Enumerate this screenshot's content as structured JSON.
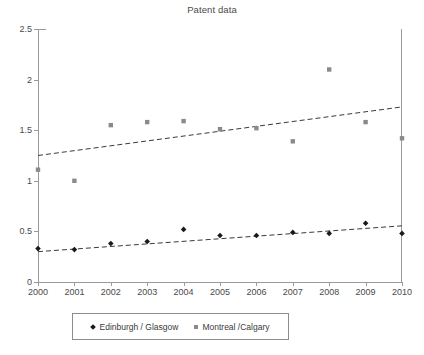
{
  "chart_data": {
    "type": "scatter",
    "title": "Patent data",
    "xlabel": "",
    "ylabel": "",
    "xlim": [
      2000,
      2010
    ],
    "ylim": [
      0,
      2.5
    ],
    "grid": false,
    "legend_position": "bottom",
    "x": [
      2000,
      2001,
      2002,
      2003,
      2004,
      2005,
      2006,
      2007,
      2008,
      2009,
      2010
    ],
    "categories": [
      "2000",
      "2001",
      "2002",
      "2003",
      "2004",
      "2005",
      "2006",
      "2007",
      "2008",
      "2009",
      "2010"
    ],
    "yticks": [
      0,
      0.5,
      1,
      1.5,
      2,
      2.5
    ],
    "ytick_labels": [
      "0",
      "0.5",
      "1",
      "1.5",
      "2",
      "2.5"
    ],
    "series": [
      {
        "name": "Edinburgh / Glasgow",
        "marker": "diamond",
        "color": "#1a1a1a",
        "values": [
          0.33,
          0.32,
          0.38,
          0.4,
          0.52,
          0.46,
          0.46,
          0.49,
          0.48,
          0.58,
          0.48
        ],
        "trendline": {
          "style": "dashed",
          "color": "#3a3a3a",
          "x_start": 2000,
          "x_end": 2010,
          "y_start": 0.3,
          "y_end": 0.555
        }
      },
      {
        "name": "Montreal /Calgary",
        "marker": "square",
        "color": "#8a8a8a",
        "values": [
          1.11,
          1.0,
          1.55,
          1.58,
          1.59,
          1.51,
          1.52,
          1.39,
          2.1,
          1.58,
          1.42
        ],
        "trendline": {
          "style": "dashed",
          "color": "#3a3a3a",
          "x_start": 2000,
          "x_end": 2010,
          "y_start": 1.25,
          "y_end": 1.73
        }
      }
    ]
  },
  "legend": {
    "entries": [
      {
        "label": "Edinburgh / Glasgow",
        "marker": "diamond"
      },
      {
        "label": "Montreal /Calgary",
        "marker": "square"
      }
    ]
  }
}
